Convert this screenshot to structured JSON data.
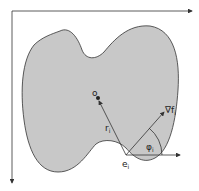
{
  "diagram": {
    "labels": {
      "origin": "o",
      "radius": "r",
      "radius_sub": "i",
      "gradient": "∇f",
      "gradient_sub": "i",
      "angle": "φ",
      "angle_sub": "i",
      "edge_point": "e",
      "edge_point_sub": "i"
    },
    "colors": {
      "shape_fill": "#c8c8c8",
      "stroke": "#333333"
    }
  }
}
